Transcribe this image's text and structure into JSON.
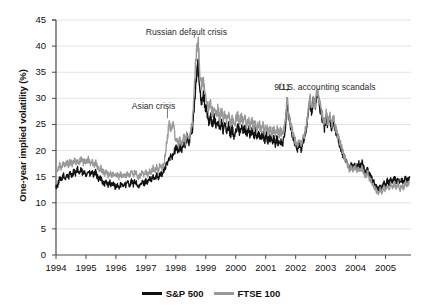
{
  "chart_data": {
    "type": "line",
    "title": "",
    "xlabel": "",
    "ylabel": "One-year implied volatility (%)",
    "xlim": [
      1994.0,
      2005.85
    ],
    "ylim": [
      0,
      45
    ],
    "ytick_step": 5,
    "grid": "horizontal",
    "legend_position": "bottom-center",
    "xticks": [
      "1994",
      "1995",
      "1996",
      "1997",
      "1998",
      "1999",
      "2000",
      "2001",
      "2002",
      "2003",
      "2004",
      "2005"
    ],
    "yticks": [
      "0",
      "5",
      "10",
      "15",
      "20",
      "25",
      "30",
      "35",
      "40",
      "45"
    ],
    "annotations": [
      {
        "text": "Asian crisis",
        "x": 1997.25,
        "y": 28.4,
        "marker_x": 1997.72,
        "marker_y": 26.0
      },
      {
        "text": "Russian default crisis",
        "x": 1998.35,
        "y": 42.6,
        "marker_x": 1998.62,
        "marker_y": 41.4
      },
      {
        "text": "9/11",
        "x": 2001.55,
        "y": 32.0,
        "marker_x": 2001.72,
        "marker_y": 31.2
      },
      {
        "text": "U.S. accounting scandals",
        "x": 2003.05,
        "y": 32.0,
        "marker_x": 2002.45,
        "marker_y": 31.5
      }
    ],
    "series": [
      {
        "name": "S&P 500",
        "color": "#111111",
        "x": [
          1994.0,
          1994.06,
          1994.12,
          1994.18,
          1994.24,
          1994.3,
          1994.36,
          1994.42,
          1994.48,
          1994.54,
          1994.6,
          1994.66,
          1994.72,
          1994.78,
          1994.84,
          1994.9,
          1994.96,
          1995.02,
          1995.08,
          1995.14,
          1995.2,
          1995.26,
          1995.32,
          1995.38,
          1995.44,
          1995.5,
          1995.56,
          1995.62,
          1995.68,
          1995.74,
          1995.8,
          1995.86,
          1995.92,
          1995.98,
          1996.04,
          1996.1,
          1996.16,
          1996.22,
          1996.28,
          1996.34,
          1996.4,
          1996.46,
          1996.52,
          1996.58,
          1996.64,
          1996.7,
          1996.76,
          1996.82,
          1996.88,
          1996.94,
          1997.0,
          1997.06,
          1997.12,
          1997.18,
          1997.24,
          1997.3,
          1997.36,
          1997.42,
          1997.48,
          1997.54,
          1997.6,
          1997.66,
          1997.72,
          1997.78,
          1997.84,
          1997.9,
          1997.96,
          1998.02,
          1998.08,
          1998.14,
          1998.2,
          1998.26,
          1998.32,
          1998.38,
          1998.44,
          1998.5,
          1998.56,
          1998.62,
          1998.68,
          1998.74,
          1998.8,
          1998.86,
          1998.92,
          1998.98,
          1999.04,
          1999.1,
          1999.16,
          1999.22,
          1999.28,
          1999.34,
          1999.4,
          1999.46,
          1999.52,
          1999.58,
          1999.64,
          1999.7,
          1999.76,
          1999.82,
          1999.88,
          1999.94,
          2000.0,
          2000.06,
          2000.12,
          2000.18,
          2000.24,
          2000.3,
          2000.36,
          2000.42,
          2000.48,
          2000.54,
          2000.6,
          2000.66,
          2000.72,
          2000.78,
          2000.84,
          2000.9,
          2000.96,
          2001.02,
          2001.08,
          2001.14,
          2001.2,
          2001.26,
          2001.32,
          2001.38,
          2001.44,
          2001.5,
          2001.56,
          2001.62,
          2001.68,
          2001.72,
          2001.76,
          2001.82,
          2001.88,
          2001.94,
          2002.0,
          2002.06,
          2002.12,
          2002.18,
          2002.24,
          2002.3,
          2002.36,
          2002.42,
          2002.48,
          2002.54,
          2002.6,
          2002.66,
          2002.72,
          2002.78,
          2002.84,
          2002.9,
          2002.96,
          2003.02,
          2003.08,
          2003.14,
          2003.2,
          2003.26,
          2003.32,
          2003.38,
          2003.44,
          2003.5,
          2003.56,
          2003.62,
          2003.68,
          2003.74,
          2003.8,
          2003.86,
          2003.92,
          2003.98,
          2004.04,
          2004.1,
          2004.16,
          2004.22,
          2004.28,
          2004.34,
          2004.4,
          2004.46,
          2004.52,
          2004.58,
          2004.64,
          2004.7,
          2004.76,
          2004.82,
          2004.88,
          2004.94,
          2005.0,
          2005.06,
          2005.12,
          2005.18,
          2005.24,
          2005.3,
          2005.36,
          2005.42,
          2005.48,
          2005.54,
          2005.6,
          2005.66,
          2005.72,
          2005.8
        ],
        "y": [
          13.0,
          13.4,
          14.6,
          14.2,
          15.3,
          14.6,
          15.4,
          14.8,
          15.8,
          15.2,
          16.2,
          15.5,
          16.4,
          15.6,
          16.3,
          15.4,
          16.0,
          15.4,
          16.1,
          15.3,
          15.9,
          15.2,
          15.8,
          15.0,
          14.4,
          14.8,
          14.0,
          13.6,
          14.1,
          13.4,
          13.9,
          13.2,
          13.7,
          13.0,
          13.4,
          12.9,
          13.5,
          13.1,
          13.8,
          13.3,
          14.0,
          13.4,
          14.1,
          13.5,
          14.2,
          13.6,
          12.8,
          13.4,
          14.0,
          13.6,
          14.3,
          13.9,
          14.6,
          14.2,
          15.0,
          14.5,
          15.3,
          14.9,
          15.8,
          15.3,
          16.2,
          16.9,
          17.6,
          18.5,
          19.4,
          18.8,
          19.9,
          20.6,
          19.8,
          21.0,
          20.2,
          21.5,
          20.8,
          22.4,
          21.6,
          23.2,
          24.5,
          28.8,
          33.6,
          36.3,
          31.6,
          29.4,
          30.8,
          28.6,
          27.2,
          25.4,
          26.6,
          25.0,
          26.2,
          24.6,
          25.8,
          24.2,
          25.4,
          23.8,
          25.0,
          23.4,
          24.6,
          23.0,
          24.2,
          22.8,
          23.9,
          24.8,
          23.6,
          24.6,
          23.4,
          24.4,
          23.2,
          24.2,
          23.0,
          23.8,
          22.6,
          23.6,
          22.4,
          23.4,
          22.2,
          23.2,
          22.0,
          22.8,
          21.8,
          22.6,
          21.6,
          22.4,
          21.4,
          22.2,
          21.2,
          22.0,
          21.0,
          22.6,
          26.4,
          29.8,
          26.5,
          24.8,
          23.4,
          22.2,
          21.0,
          20.4,
          21.6,
          20.2,
          21.8,
          22.6,
          24.4,
          26.8,
          29.6,
          27.4,
          30.2,
          28.4,
          31.2,
          29.0,
          27.5,
          25.8,
          24.2,
          26.4,
          24.8,
          26.2,
          24.4,
          25.8,
          24.0,
          23.0,
          21.8,
          20.6,
          19.4,
          18.6,
          17.8,
          17.0,
          16.4,
          17.2,
          16.6,
          17.4,
          16.8,
          17.6,
          16.9,
          17.7,
          16.5,
          15.8,
          16.6,
          15.4,
          14.8,
          14.2,
          13.6,
          13.0,
          12.4,
          13.4,
          12.8,
          13.8,
          13.2,
          14.2,
          13.6,
          14.6,
          14.0,
          14.8,
          13.9,
          14.7,
          13.5,
          14.4,
          13.8,
          14.8,
          14.2,
          15.0
        ]
      },
      {
        "name": "FTSE 100",
        "color": "#999999",
        "x": [
          1994.0,
          1994.06,
          1994.12,
          1994.18,
          1994.24,
          1994.3,
          1994.36,
          1994.42,
          1994.48,
          1994.54,
          1994.6,
          1994.66,
          1994.72,
          1994.78,
          1994.84,
          1994.9,
          1994.96,
          1995.02,
          1995.08,
          1995.14,
          1995.2,
          1995.26,
          1995.32,
          1995.38,
          1995.44,
          1995.5,
          1995.56,
          1995.62,
          1995.68,
          1995.74,
          1995.8,
          1995.86,
          1995.92,
          1995.98,
          1996.04,
          1996.1,
          1996.16,
          1996.22,
          1996.28,
          1996.34,
          1996.4,
          1996.46,
          1996.52,
          1996.58,
          1996.64,
          1996.7,
          1996.76,
          1996.82,
          1996.88,
          1996.94,
          1997.0,
          1997.06,
          1997.12,
          1997.18,
          1997.24,
          1997.3,
          1997.36,
          1997.42,
          1997.48,
          1997.54,
          1997.6,
          1997.66,
          1997.72,
          1997.78,
          1997.84,
          1997.9,
          1997.96,
          1998.02,
          1998.08,
          1998.14,
          1998.2,
          1998.26,
          1998.32,
          1998.38,
          1998.44,
          1998.5,
          1998.56,
          1998.62,
          1998.68,
          1998.74,
          1998.8,
          1998.86,
          1998.92,
          1998.98,
          1999.04,
          1999.1,
          1999.16,
          1999.22,
          1999.28,
          1999.34,
          1999.4,
          1999.46,
          1999.52,
          1999.58,
          1999.64,
          1999.7,
          1999.76,
          1999.82,
          1999.88,
          1999.94,
          2000.0,
          2000.06,
          2000.12,
          2000.18,
          2000.24,
          2000.3,
          2000.36,
          2000.42,
          2000.48,
          2000.54,
          2000.6,
          2000.66,
          2000.72,
          2000.78,
          2000.84,
          2000.9,
          2000.96,
          2001.02,
          2001.08,
          2001.14,
          2001.2,
          2001.26,
          2001.32,
          2001.38,
          2001.44,
          2001.5,
          2001.56,
          2001.62,
          2001.68,
          2001.72,
          2001.76,
          2001.82,
          2001.88,
          2001.94,
          2002.0,
          2002.06,
          2002.12,
          2002.18,
          2002.24,
          2002.3,
          2002.36,
          2002.42,
          2002.48,
          2002.54,
          2002.6,
          2002.66,
          2002.72,
          2002.78,
          2002.84,
          2002.9,
          2002.96,
          2003.02,
          2003.08,
          2003.14,
          2003.2,
          2003.26,
          2003.32,
          2003.38,
          2003.44,
          2003.5,
          2003.56,
          2003.62,
          2003.68,
          2003.74,
          2003.8,
          2003.86,
          2003.92,
          2003.98,
          2004.04,
          2004.1,
          2004.16,
          2004.22,
          2004.28,
          2004.34,
          2004.4,
          2004.46,
          2004.52,
          2004.58,
          2004.64,
          2004.7,
          2004.76,
          2004.82,
          2004.88,
          2004.94,
          2005.0,
          2005.06,
          2005.12,
          2005.18,
          2005.24,
          2005.3,
          2005.36,
          2005.42,
          2005.48,
          2005.54,
          2005.6,
          2005.66,
          2005.72,
          2005.8
        ],
        "y": [
          15.6,
          16.4,
          17.2,
          16.8,
          17.6,
          17.0,
          17.8,
          17.2,
          18.0,
          17.4,
          18.2,
          17.6,
          18.3,
          17.8,
          18.4,
          17.6,
          18.2,
          17.6,
          18.3,
          17.5,
          18.1,
          17.2,
          17.8,
          16.9,
          16.3,
          16.7,
          16.0,
          15.5,
          16.0,
          15.3,
          15.8,
          15.2,
          15.6,
          15.0,
          15.4,
          14.9,
          15.5,
          15.0,
          15.6,
          15.1,
          15.7,
          15.2,
          15.8,
          15.2,
          15.9,
          15.3,
          14.8,
          15.2,
          15.8,
          15.4,
          16.0,
          15.5,
          16.2,
          15.8,
          16.6,
          16.0,
          16.8,
          16.3,
          17.2,
          16.6,
          17.5,
          19.8,
          22.6,
          25.4,
          23.8,
          25.6,
          23.2,
          22.0,
          21.0,
          22.2,
          21.2,
          22.6,
          21.8,
          23.4,
          22.2,
          24.0,
          26.0,
          32.4,
          38.6,
          41.2,
          35.2,
          32.0,
          33.8,
          31.0,
          29.6,
          27.8,
          29.0,
          27.2,
          28.4,
          26.8,
          28.0,
          26.4,
          27.6,
          26.0,
          27.2,
          25.6,
          26.8,
          25.2,
          26.4,
          24.8,
          25.8,
          26.8,
          25.4,
          26.4,
          25.2,
          26.2,
          25.0,
          26.0,
          24.8,
          25.6,
          24.4,
          25.4,
          24.2,
          25.2,
          24.0,
          25.0,
          23.8,
          24.6,
          23.6,
          24.4,
          23.4,
          24.2,
          23.2,
          24.0,
          23.0,
          23.8,
          22.8,
          24.2,
          27.0,
          30.4,
          27.2,
          25.4,
          24.0,
          22.8,
          21.6,
          21.0,
          22.2,
          20.8,
          22.4,
          23.2,
          25.0,
          27.4,
          30.4,
          28.0,
          31.0,
          29.0,
          31.8,
          29.6,
          28.0,
          26.4,
          24.8,
          27.0,
          25.4,
          26.8,
          25.0,
          26.4,
          24.6,
          23.6,
          22.4,
          21.2,
          20.0,
          19.0,
          18.0,
          17.2,
          16.4,
          17.0,
          16.2,
          16.8,
          16.0,
          16.8,
          16.1,
          16.9,
          15.7,
          15.0,
          15.8,
          14.6,
          14.0,
          13.4,
          12.8,
          12.2,
          11.6,
          12.6,
          12.0,
          13.0,
          12.4,
          13.4,
          12.8,
          13.6,
          13.0,
          13.8,
          12.9,
          13.7,
          12.5,
          13.4,
          12.8,
          13.8,
          13.2,
          14.0
        ]
      }
    ]
  },
  "legend": {
    "items": [
      {
        "label": "S&P 500",
        "color": "#111111"
      },
      {
        "label": "FTSE 100",
        "color": "#999999"
      }
    ]
  }
}
